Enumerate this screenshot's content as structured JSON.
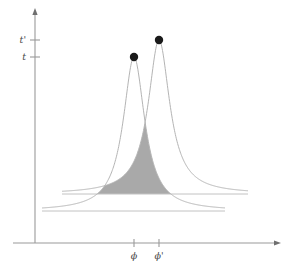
{
  "figure": {
    "title": "",
    "background_color": "#ffffff"
  },
  "axes": {
    "x_axis_name": "x-axis",
    "y_axis_name": "y-axis",
    "axis_color": "#9a9a9a",
    "origin_px": {
      "x": 35,
      "y": 243
    },
    "x_end_px": 277,
    "y_top_px": 12,
    "has_arrowheads": true
  },
  "y_ticks": [
    {
      "label": "t'",
      "pixel_y": 40,
      "name": "y-tick-t-prime"
    },
    {
      "label": "t",
      "pixel_y": 57,
      "name": "y-tick-t"
    }
  ],
  "x_ticks": [
    {
      "label": "ϕ",
      "pixel_x": 134,
      "name": "x-tick-phi"
    },
    {
      "label": "ϕ'",
      "pixel_x": 159,
      "name": "x-tick-phi-prime"
    }
  ],
  "curves": [
    {
      "name": "left-curve",
      "peak_label": "t",
      "center_label": "ϕ",
      "peak_x_px": 134,
      "peak_y_px": 57,
      "baseline_y_px": 211,
      "baseline_x_start_px": 42,
      "baseline_x_end_px": 225,
      "half_width_px": 13,
      "stroke_color": "#b4b4b4"
    },
    {
      "name": "right-curve",
      "peak_label": "t'",
      "center_label": "ϕ'",
      "peak_x_px": 159,
      "peak_y_px": 40,
      "baseline_y_px": 194,
      "baseline_x_start_px": 62,
      "baseline_x_end_px": 248,
      "half_width_px": 13,
      "stroke_color": "#b4b4b4"
    }
  ],
  "markers": [
    {
      "name": "peak-dot-left",
      "x_px": 134,
      "y_px": 57,
      "radius_px": 4.2,
      "color": "#1a1a1a"
    },
    {
      "name": "peak-dot-right",
      "x_px": 159,
      "y_px": 40,
      "radius_px": 4.2,
      "color": "#1a1a1a"
    }
  ],
  "shaded_region": {
    "name": "overlap-region",
    "description": "overlap between the two curves",
    "fill_color": "#a9a9a9",
    "crossing_point_px": {
      "x": 147,
      "y": 100
    },
    "bottom_y_px": 194
  },
  "chart_data": {
    "type": "line",
    "title": "",
    "xlabel": "",
    "ylabel": "",
    "grid": false,
    "legend": "none",
    "xlim": [
      35,
      277
    ],
    "ylim": [
      243,
      12
    ],
    "x_tick_labels": [
      "ϕ",
      "ϕ'"
    ],
    "y_tick_labels": [
      "t",
      "t'"
    ],
    "series": [
      {
        "name": "left-curve",
        "peak_center": "ϕ",
        "peak_height": "t",
        "baseline": "lower",
        "shape": "lorentzian"
      },
      {
        "name": "right-curve",
        "peak_center": "ϕ'",
        "peak_height": "t'",
        "baseline": "upper",
        "shape": "lorentzian"
      }
    ],
    "annotations": [
      {
        "type": "point",
        "label": "t",
        "at_x": "ϕ",
        "at_y": "t"
      },
      {
        "type": "point",
        "label": "t'",
        "at_x": "ϕ'",
        "at_y": "t'"
      },
      {
        "type": "shaded-area",
        "label": "overlap",
        "color": "#a9a9a9"
      }
    ]
  }
}
